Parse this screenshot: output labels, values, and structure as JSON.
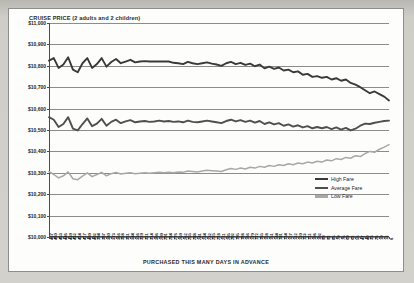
{
  "chart_data": {
    "type": "line",
    "title": "CRUISE PRICE (2 adults and 2 children)",
    "xlabel": "PURCHASED THIS MANY DAYS IN ADVANCE",
    "ylabel": "",
    "ylim": [
      10000,
      11000
    ],
    "ytick_labels": [
      "$11,000",
      "$10,900",
      "$10,800",
      "$10,700",
      "$10,600",
      "$10,500",
      "$10,400",
      "$10,300",
      "$10,200",
      "$10,100",
      "$10,000"
    ],
    "ytick_values": [
      11000,
      10900,
      10800,
      10700,
      10600,
      10500,
      10400,
      10300,
      10200,
      10100,
      10000
    ],
    "grid": true,
    "legend_position": "bottom-right",
    "x_axis_note": "days in advance, descending left to right",
    "categories": [
      467,
      460,
      453,
      446,
      439,
      432,
      424,
      417,
      409,
      402,
      394,
      387,
      380,
      373,
      366,
      358,
      351,
      344,
      336,
      329,
      321,
      314,
      306,
      299,
      291,
      284,
      276,
      269,
      262,
      255,
      248,
      241,
      234,
      232,
      225,
      218,
      211,
      205,
      202,
      195,
      188,
      186,
      179,
      172,
      165,
      158,
      151,
      144,
      141,
      134,
      127,
      122,
      120,
      113,
      112,
      106,
      102,
      99,
      92,
      85,
      79,
      76,
      69,
      62,
      55,
      47,
      40,
      33,
      26,
      19,
      12,
      8
    ],
    "series": [
      {
        "name": "High Fare",
        "color": "#3a3a3a",
        "values": [
          10824,
          10836,
          10790,
          10806,
          10840,
          10782,
          10770,
          10812,
          10836,
          10790,
          10808,
          10836,
          10796,
          10818,
          10832,
          10812,
          10820,
          10828,
          10816,
          10820,
          10822,
          10820,
          10820,
          10820,
          10820,
          10820,
          10814,
          10812,
          10808,
          10818,
          10812,
          10808,
          10812,
          10816,
          10810,
          10806,
          10800,
          10812,
          10818,
          10808,
          10814,
          10804,
          10810,
          10798,
          10806,
          10788,
          10796,
          10786,
          10792,
          10778,
          10782,
          10770,
          10774,
          10758,
          10762,
          10748,
          10752,
          10744,
          10748,
          10736,
          10742,
          10730,
          10736,
          10720,
          10712,
          10700,
          10686,
          10672,
          10680,
          10668,
          10656,
          10638
        ]
      },
      {
        "name": "Average Fare",
        "color": "#4f4f4f",
        "values": [
          10560,
          10548,
          10514,
          10528,
          10560,
          10506,
          10498,
          10528,
          10554,
          10518,
          10530,
          10552,
          10520,
          10538,
          10548,
          10532,
          10540,
          10546,
          10536,
          10540,
          10542,
          10538,
          10540,
          10544,
          10540,
          10542,
          10538,
          10540,
          10536,
          10544,
          10538,
          10536,
          10540,
          10544,
          10540,
          10536,
          10532,
          10542,
          10548,
          10540,
          10546,
          10538,
          10544,
          10534,
          10542,
          10528,
          10536,
          10526,
          10532,
          10520,
          10526,
          10516,
          10522,
          10512,
          10518,
          10508,
          10514,
          10508,
          10514,
          10504,
          10512,
          10502,
          10510,
          10498,
          10506,
          10520,
          10530,
          10528,
          10534,
          10538,
          10542,
          10544
        ]
      },
      {
        "name": "Low Fare",
        "color": "#a8a8a8",
        "values": [
          10306,
          10292,
          10276,
          10286,
          10304,
          10272,
          10268,
          10284,
          10300,
          10282,
          10292,
          10302,
          10286,
          10296,
          10302,
          10294,
          10298,
          10300,
          10296,
          10298,
          10300,
          10298,
          10300,
          10302,
          10300,
          10302,
          10300,
          10304,
          10302,
          10308,
          10306,
          10304,
          10308,
          10312,
          10310,
          10308,
          10306,
          10314,
          10320,
          10316,
          10322,
          10318,
          10326,
          10322,
          10330,
          10326,
          10334,
          10330,
          10338,
          10334,
          10342,
          10338,
          10346,
          10342,
          10350,
          10346,
          10354,
          10350,
          10360,
          10356,
          10366,
          10362,
          10372,
          10368,
          10380,
          10376,
          10390,
          10400,
          10396,
          10410,
          10420,
          10432
        ]
      }
    ]
  },
  "legend": {
    "items": [
      {
        "label": "High Fare",
        "color": "#3a3a3a"
      },
      {
        "label": "Average Fare",
        "color": "#4f4f4f"
      },
      {
        "label": "Low Fare",
        "color": "#a8a8a8"
      }
    ]
  }
}
